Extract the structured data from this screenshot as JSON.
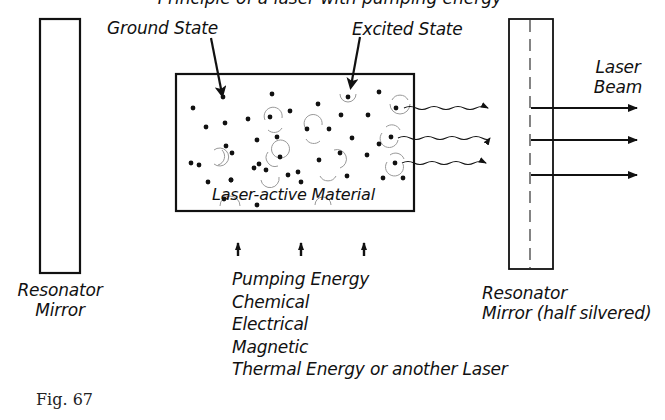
{
  "diagram": {
    "title_partial": "Principle of a laser with pumping energy",
    "labels": {
      "ground_state": "Ground State",
      "excited_state": "Excited State",
      "laser_beam_line1": "Laser",
      "laser_beam_line2": "Beam",
      "material": "Laser-active Material",
      "left_mirror_line1": "Resonator",
      "left_mirror_line2": "Mirror",
      "right_mirror_line1": "Resonator",
      "right_mirror_line2": "Mirror (half silvered)",
      "figure": "Fig. 67"
    },
    "pumping": [
      "Pumping Energy",
      "Chemical",
      "Electrical",
      "Magnetic",
      "Thermal Energy or another Laser"
    ],
    "colors": {
      "ink": "#111111",
      "halo": "#9a9a9a",
      "background": "#ffffff"
    }
  }
}
